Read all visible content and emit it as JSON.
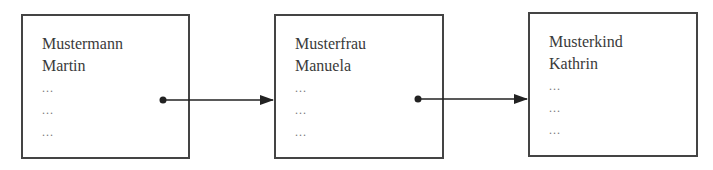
{
  "diagram": {
    "type": "linked-list",
    "nodes": [
      {
        "id": "node-1",
        "lines": [
          "Mustermann",
          "Martin",
          "...",
          "...",
          "..."
        ],
        "box": {
          "x": 21,
          "y": 14,
          "w": 169,
          "h": 145
        }
      },
      {
        "id": "node-2",
        "lines": [
          "Musterfrau",
          "Manuela",
          "...",
          "...",
          "..."
        ],
        "box": {
          "x": 274,
          "y": 14,
          "w": 170,
          "h": 145
        }
      },
      {
        "id": "node-3",
        "lines": [
          "Musterkind",
          "Kathrin",
          "...",
          "...",
          "..."
        ],
        "box": {
          "x": 528,
          "y": 12,
          "w": 170,
          "h": 145
        }
      }
    ],
    "edges": [
      {
        "from": "node-1",
        "to": "node-2",
        "start": {
          "x": 163,
          "y": 100
        },
        "end": {
          "x": 274,
          "y": 100
        }
      },
      {
        "from": "node-2",
        "to": "node-3",
        "start": {
          "x": 418,
          "y": 99
        },
        "end": {
          "x": 528,
          "y": 99
        }
      }
    ],
    "colors": {
      "stroke": "#444444",
      "text": "#3a3a3a",
      "arrow": "#222222"
    }
  }
}
